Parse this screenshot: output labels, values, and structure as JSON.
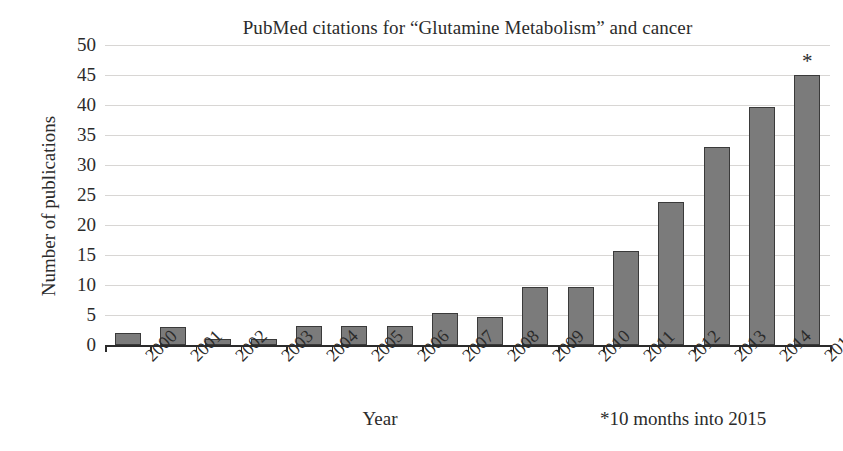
{
  "chart_data": {
    "type": "bar",
    "title": "PubMed citations for “Glutamine Metabolism” and cancer",
    "xlabel": "Year",
    "ylabel": "Number of publications",
    "categories": [
      "2000",
      "2001",
      "2002",
      "2003",
      "2004",
      "2005",
      "2006",
      "2007",
      "2008",
      "2009",
      "2010",
      "2011",
      "2012",
      "2013",
      "2014",
      "2015"
    ],
    "values": [
      2,
      3,
      1,
      1,
      3.2,
      3.2,
      3.2,
      5.4,
      4.6,
      9.6,
      9.6,
      15.6,
      23.8,
      33,
      39.7,
      45
    ],
    "ylim": [
      0,
      50
    ],
    "yticks": [
      0,
      5,
      10,
      15,
      20,
      25,
      30,
      35,
      40,
      45,
      50
    ],
    "ytick_labels": [
      "0",
      "5",
      "10",
      "15",
      "20",
      "25",
      "30",
      "35",
      "40",
      "45",
      "50"
    ],
    "grid": true,
    "legend": false,
    "bar_color": "#7b7b7b",
    "bar_edge_color": "#3a3a3a",
    "gridline_color": "#d8d6d4",
    "axis_color": "#2b2b2b",
    "background": "#ffffff",
    "annotations": [
      {
        "name": "asterisk-2015",
        "text": "*",
        "category": "2015",
        "note": "marker above final bar"
      },
      {
        "name": "footnote",
        "text": "*10 months into 2015"
      }
    ]
  }
}
